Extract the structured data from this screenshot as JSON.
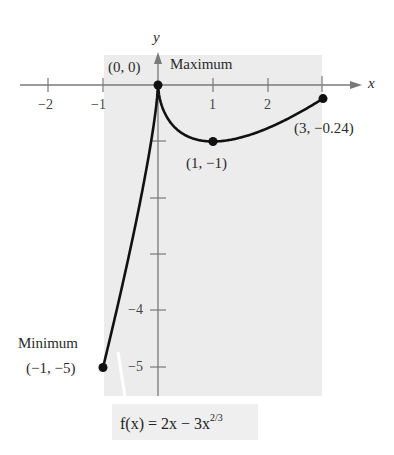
{
  "chart_data": {
    "type": "line",
    "title": "",
    "function_label": "f(x) = 2x − 3x^(2/3)",
    "function_parts": {
      "prefix": "f(x) = 2x − 3x",
      "exponent": "2/3"
    },
    "xlabel": "x",
    "ylabel": "y",
    "xlim": [
      -2.5,
      3.5
    ],
    "ylim": [
      -5.5,
      0.5
    ],
    "domain_shaded": [
      -1,
      3
    ],
    "x_ticks": [
      -2,
      -1,
      1,
      2,
      3
    ],
    "x_tick_labels": [
      "−2",
      "−1",
      "1",
      "2",
      ""
    ],
    "y_ticks": [
      -1,
      -2,
      -3,
      -4,
      -5
    ],
    "y_tick_labels": [
      "",
      "",
      "",
      "−4",
      "−5"
    ],
    "grid": false,
    "series": [
      {
        "name": "f(x) = 2x − 3x^(2/3)",
        "x": [
          -1,
          -0.75,
          -0.5,
          -0.25,
          -0.1,
          0,
          0.05,
          0.1,
          0.2,
          0.3,
          0.5,
          0.75,
          1,
          1.25,
          1.5,
          2,
          2.5,
          3
        ],
        "y": [
          -5,
          -4.07,
          -2.89,
          -1.69,
          -0.846,
          0,
          -0.309,
          -0.446,
          -0.626,
          -0.743,
          -0.89,
          -0.975,
          -1,
          -0.981,
          -0.934,
          -0.762,
          -0.524,
          -0.24
        ]
      }
    ],
    "points": [
      {
        "x": 0,
        "y": 0,
        "label": "(0, 0)",
        "annotation": "Maximum"
      },
      {
        "x": 1,
        "y": -1,
        "label": "(1, −1)",
        "annotation": ""
      },
      {
        "x": 3,
        "y": -0.24,
        "label": "(3, −0.24)",
        "annotation": ""
      },
      {
        "x": -1,
        "y": -5,
        "label": "(−1, −5)",
        "annotation": "Minimum"
      }
    ]
  },
  "labels": {
    "y_axis": "y",
    "x_axis": "x",
    "origin_point": "(0, 0)",
    "maximum": "Maximum",
    "point_1": "(1, −1)",
    "point_3": "(3, −0.24)",
    "minimum": "Minimum",
    "min_point": "(−1, −5)",
    "tick_x_neg2": "−2",
    "tick_x_neg1": "−1",
    "tick_x_1": "1",
    "tick_x_2": "2",
    "tick_y_neg4": "−4",
    "tick_y_neg5": "−5",
    "formula_prefix": "f(x) = 2x − 3x",
    "formula_exponent": "2/3"
  },
  "colors": {
    "shade": "#ececec",
    "axis": "#7a7a7a",
    "curve": "#111111",
    "point": "#111111"
  }
}
